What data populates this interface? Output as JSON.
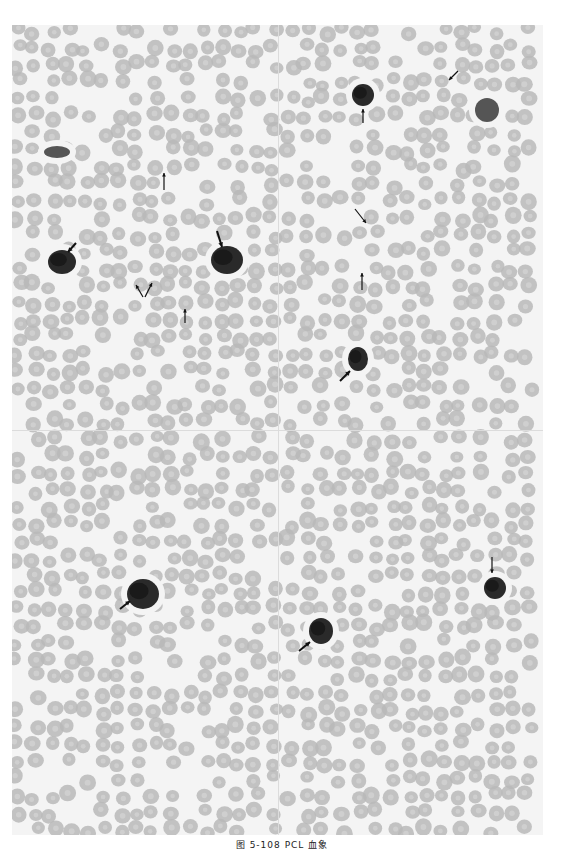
{
  "figure": {
    "caption": "图 5-108   PCL 血象",
    "colors": {
      "background": "#f4f4f4",
      "rbc_fill": "#b9b9b9",
      "rbc_center": "#d2d2d2",
      "cell_dark": "#2a2a2a",
      "cell_mid": "#555555",
      "arrow": "#111111"
    },
    "panels": [
      {
        "id": "top-left",
        "x": 0,
        "y": 0,
        "w": 266,
        "h": 405
      },
      {
        "id": "top-right",
        "x": 266,
        "y": 0,
        "w": 265,
        "h": 405
      },
      {
        "id": "bottom-left",
        "x": 0,
        "y": 405,
        "w": 266,
        "h": 405
      },
      {
        "id": "bottom-right",
        "x": 266,
        "y": 405,
        "w": 265,
        "h": 405
      }
    ],
    "cells": [
      {
        "type": "neutrophil",
        "x": 45,
        "y": 127,
        "rx": 13,
        "ry": 6
      },
      {
        "type": "plasma-cell",
        "x": 50,
        "y": 237,
        "rx": 14,
        "ry": 12
      },
      {
        "type": "plasma-cell",
        "x": 215,
        "y": 235,
        "rx": 16,
        "ry": 14
      },
      {
        "type": "plasma-cell",
        "x": 351,
        "y": 70,
        "rx": 11,
        "ry": 11
      },
      {
        "type": "neutrophil",
        "x": 475,
        "y": 85,
        "rx": 12,
        "ry": 12
      },
      {
        "type": "plasma-cell",
        "x": 346,
        "y": 334,
        "rx": 10,
        "ry": 12
      },
      {
        "type": "plasma-cell",
        "x": 131,
        "y": 569,
        "rx": 16,
        "ry": 15
      },
      {
        "type": "plasma-cell",
        "x": 309,
        "y": 606,
        "rx": 12,
        "ry": 13
      },
      {
        "type": "plasma-cell",
        "x": 483,
        "y": 563,
        "rx": 11,
        "ry": 11
      }
    ],
    "arrows": [
      {
        "x1": 152,
        "y1": 165,
        "x2": 152,
        "y2": 148,
        "bold": false
      },
      {
        "x1": 64,
        "y1": 218,
        "x2": 56,
        "y2": 227,
        "bold": true
      },
      {
        "x1": 205,
        "y1": 206,
        "x2": 210,
        "y2": 222,
        "bold": true
      },
      {
        "x1": 131,
        "y1": 272,
        "x2": 124,
        "y2": 260,
        "bold": false
      },
      {
        "x1": 133,
        "y1": 272,
        "x2": 140,
        "y2": 258,
        "bold": false
      },
      {
        "x1": 173,
        "y1": 298,
        "x2": 173,
        "y2": 284,
        "bold": false
      },
      {
        "x1": 351,
        "y1": 98,
        "x2": 351,
        "y2": 84,
        "bold": false
      },
      {
        "x1": 446,
        "y1": 46,
        "x2": 437,
        "y2": 55,
        "bold": false
      },
      {
        "x1": 343,
        "y1": 184,
        "x2": 354,
        "y2": 198,
        "bold": false
      },
      {
        "x1": 350,
        "y1": 265,
        "x2": 350,
        "y2": 248,
        "bold": false
      },
      {
        "x1": 328,
        "y1": 356,
        "x2": 338,
        "y2": 346,
        "bold": true
      },
      {
        "x1": 108,
        "y1": 584,
        "x2": 118,
        "y2": 576,
        "bold": true
      },
      {
        "x1": 287,
        "y1": 626,
        "x2": 298,
        "y2": 617,
        "bold": true
      },
      {
        "x1": 480,
        "y1": 532,
        "x2": 480,
        "y2": 548,
        "bold": false
      }
    ]
  }
}
